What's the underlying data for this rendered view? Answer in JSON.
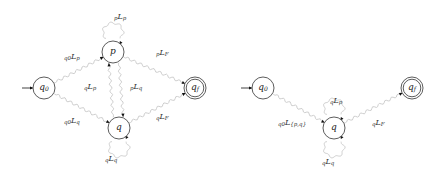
{
  "colors": {
    "node_stroke": "#333333",
    "edge_stroke": "#c8c8c8",
    "arrow": "#111111",
    "text": "#333333"
  },
  "left_diagram": {
    "nodes": [
      {
        "id": "q0",
        "label": "q",
        "sub": "0",
        "x": 44,
        "y": 88,
        "initial": true,
        "final": false
      },
      {
        "id": "p",
        "label": "p",
        "sub": "",
        "x": 113,
        "y": 52,
        "initial": false,
        "final": false
      },
      {
        "id": "q",
        "label": "q",
        "sub": "",
        "x": 119,
        "y": 128,
        "initial": false,
        "final": false
      },
      {
        "id": "qf",
        "label": "q",
        "sub": "f",
        "x": 195,
        "y": 88,
        "initial": false,
        "final": true
      }
    ],
    "edges": [
      {
        "from": "q0",
        "to": "p",
        "pre": "q0",
        "label": "L",
        "sub": "p"
      },
      {
        "from": "q0",
        "to": "q",
        "pre": "q0",
        "label": "L",
        "sub": "q"
      },
      {
        "from": "p",
        "to": "p",
        "pre": "p",
        "label": "L",
        "sub": "p"
      },
      {
        "from": "q",
        "to": "p",
        "pre": "q",
        "label": "L",
        "sub": "p"
      },
      {
        "from": "p",
        "to": "q",
        "pre": "p",
        "label": "L",
        "sub": "q"
      },
      {
        "from": "p",
        "to": "qf",
        "pre": "p",
        "label": "L",
        "sub": "F"
      },
      {
        "from": "q",
        "to": "qf",
        "pre": "q",
        "label": "L",
        "sub": "F"
      },
      {
        "from": "q",
        "to": "q",
        "pre": "q",
        "label": "L",
        "sub": "q"
      }
    ],
    "edge_labels": {
      "q0_p": {
        "pre": "q0",
        "main": "L",
        "sub": "p"
      },
      "q0_q": {
        "pre": "q0",
        "main": "L",
        "sub": "q"
      },
      "p_p": {
        "pre": "p",
        "main": "L",
        "sub": "p"
      },
      "q_p": {
        "pre": "q",
        "main": "L",
        "sub": "p"
      },
      "p_q": {
        "pre": "p",
        "main": "L",
        "sub": "q"
      },
      "p_qf": {
        "pre": "p",
        "main": "L",
        "sub": "F"
      },
      "q_qf": {
        "pre": "q",
        "main": "L",
        "sub": "F"
      },
      "q_q": {
        "pre": "q",
        "main": "L",
        "sub": "q"
      }
    }
  },
  "right_diagram": {
    "nodes": [
      {
        "id": "q0",
        "label": "q",
        "sub": "0",
        "x": 263,
        "y": 88,
        "initial": true,
        "final": false
      },
      {
        "id": "q",
        "label": "q",
        "sub": "",
        "x": 334,
        "y": 128,
        "initial": false,
        "final": false
      },
      {
        "id": "qf",
        "label": "q",
        "sub": "f",
        "x": 412,
        "y": 88,
        "initial": false,
        "final": true
      }
    ],
    "edge_labels": {
      "q0_q": {
        "pre": "q0",
        "main": "L",
        "sub": "{p,q}"
      },
      "q_q_top": {
        "pre": "q",
        "main": "L",
        "sub": "p"
      },
      "q_q_bottom": {
        "pre": "q",
        "main": "L",
        "sub": "q"
      },
      "q_qf": {
        "pre": "q",
        "main": "L",
        "sub": "F"
      }
    }
  }
}
